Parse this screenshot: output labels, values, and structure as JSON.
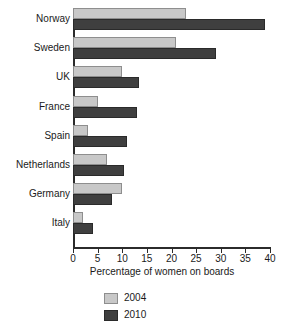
{
  "chart_data": {
    "type": "bar",
    "orientation": "horizontal",
    "title": "",
    "xlabel": "Percentage of women on boards",
    "ylabel": "",
    "xlim": [
      0,
      40
    ],
    "xticks": [
      0,
      5,
      10,
      15,
      20,
      25,
      30,
      35,
      40
    ],
    "grid": false,
    "legend_position": "bottom",
    "categories": [
      "Norway",
      "Sweden",
      "UK",
      "France",
      "Spain",
      "Netherlands",
      "Germany",
      "Italy"
    ],
    "series": [
      {
        "name": "2004",
        "color": "#c8c8c8",
        "values": [
          23,
          21,
          10,
          5,
          3,
          7,
          10,
          2
        ]
      },
      {
        "name": "2010",
        "color": "#3f3f3f",
        "values": [
          39,
          29,
          13.5,
          13,
          11,
          10.3,
          8,
          4
        ]
      }
    ]
  },
  "legend": {
    "items": [
      {
        "label": "2004"
      },
      {
        "label": "2010"
      }
    ]
  }
}
